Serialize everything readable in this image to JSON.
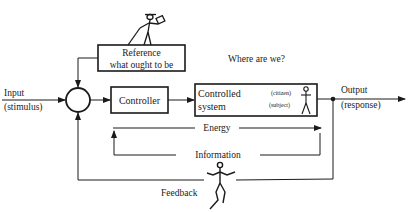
{
  "diagram": {
    "input": {
      "label": "Input",
      "sublabel": "(stimulus)"
    },
    "reference": {
      "line1": "Reference",
      "line2": "what ought to be"
    },
    "question": "Where are we?",
    "controller": {
      "label": "Controller"
    },
    "controlled_system": {
      "line1": "Controlled",
      "line2": "system",
      "role1": "(citizen)",
      "role2": "(subject)"
    },
    "output": {
      "label": "Output",
      "sublabel": "(response)"
    },
    "energy": {
      "label": "Energy"
    },
    "information": {
      "label": "Information"
    },
    "feedback": {
      "label": "Feedback"
    },
    "colors": {
      "ink": "#1a1a1a",
      "background": "#ffffff"
    }
  }
}
